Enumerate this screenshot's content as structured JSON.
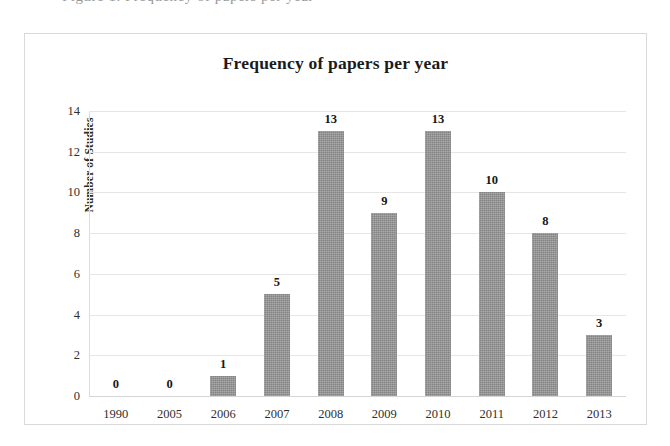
{
  "page": {
    "cut_off_header_text": "Figure 1. Frequency of papers per year"
  },
  "chart_data": {
    "type": "bar",
    "title": "Frequency of papers per year",
    "xlabel": "",
    "ylabel": "Number of Studies",
    "categories": [
      "1990",
      "2005",
      "2006",
      "2007",
      "2008",
      "2009",
      "2010",
      "2011",
      "2012",
      "2013"
    ],
    "values": [
      0,
      0,
      1,
      5,
      13,
      9,
      13,
      10,
      8,
      3
    ],
    "data_labels": [
      "0",
      "0",
      "1",
      "5",
      "13",
      "9",
      "13",
      "10",
      "8",
      "3"
    ],
    "ylim": [
      0,
      14
    ],
    "y_ticks": [
      0,
      2,
      4,
      6,
      8,
      10,
      12,
      14
    ],
    "y_tick_labels": [
      "0",
      "2",
      "4",
      "6",
      "8",
      "10",
      "12",
      "14"
    ],
    "grid": true,
    "grid_axis": "y",
    "legend": false,
    "legend_position": "none",
    "bar_color": "#949494",
    "gridline_color": "#e6e6e6",
    "frame_color": "#d9d9d9",
    "text_color": "#2f2f2f",
    "background_color": "#ffffff"
  }
}
